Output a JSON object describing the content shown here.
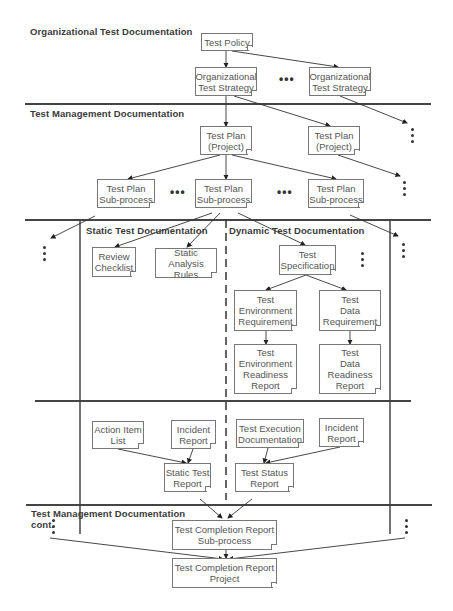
{
  "sections": {
    "organizational": "Organizational Test Documentation",
    "management": "Test Management Documentation",
    "static": "Static Test Documentation",
    "dynamic": "Dynamic Test Documentation",
    "management_cont": "Test Management  Documentation\ncont."
  },
  "boxes": {
    "test_policy": "Test Policy",
    "org_strategy_1": "Organizational\nTest Strategy",
    "org_strategy_2": "Organizational\nTest Strategy",
    "plan_project_1": "Test Plan\n(Project)",
    "plan_project_2": "Test Plan\n(Project)",
    "plan_sub_1": "Test Plan\nSub-process",
    "plan_sub_2": "Test Plan\nSub-process",
    "plan_sub_3": "Test Plan\nSub-process",
    "review_checklist": "Review\nChecklist",
    "static_analysis_rules": "Static Analysis\nRules",
    "test_specification": "Test\nSpecification",
    "env_requirement": "Test\nEnvironment\nRequirement",
    "data_requirement": "Test\nData\nRequirement",
    "env_readiness": "Test\nEnvironment\nReadiness\nReport",
    "data_readiness": "Test\nData\nReadiness\nReport",
    "action_item_list": "Action Item\nList",
    "incident_report_static": "Incident\nReport",
    "test_execution_doc": "Test Execution\nDocumentation",
    "incident_report_dynamic": "Incident\nReport",
    "static_test_report": "Static Test\nReport",
    "test_status_report": "Test Status\nReport",
    "completion_sub": "Test Completion Report\nSub-process",
    "completion_project": "Test Completion Report\nProject"
  },
  "ellipsis": "•••"
}
